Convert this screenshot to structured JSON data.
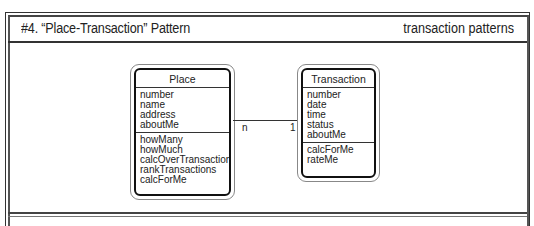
{
  "header": {
    "title": "#4. “Place-Transaction” Pattern",
    "category": "transaction patterns"
  },
  "diagram": {
    "classes": [
      {
        "name": "Place",
        "attributes": [
          "number",
          "name",
          "address",
          "aboutMe"
        ],
        "services": [
          "howMany",
          "howMuch",
          "calcOverTransactions",
          "rankTransactions",
          "calcForMe"
        ]
      },
      {
        "name": "Transaction",
        "attributes": [
          "number",
          "date",
          "time",
          "status",
          "aboutMe"
        ],
        "services": [
          "calcForMe",
          "rateMe"
        ]
      }
    ],
    "association": {
      "from": "Place",
      "to": "Transaction",
      "from_multiplicity": "n",
      "to_multiplicity": "1"
    }
  }
}
